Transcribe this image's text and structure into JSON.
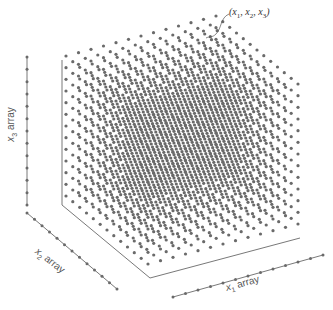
{
  "figure": {
    "type": "3d-meshgrid-diagram",
    "callout_label": "(x1, x2, x3)",
    "callout_parts": {
      "x1": "x",
      "x1_sub": "1",
      "x2": "x",
      "x2_sub": "2",
      "x3": "x",
      "x3_sub": "3"
    },
    "axes": [
      {
        "name": "x1",
        "label_var": "x",
        "label_sub": "1",
        "label_text": "array",
        "direction": "horizontal-right",
        "points": 13
      },
      {
        "name": "x2",
        "label_var": "x",
        "label_sub": "2",
        "label_text": "array",
        "direction": "diagonal-front",
        "points": 13
      },
      {
        "name": "x3",
        "label_var": "x",
        "label_sub": "3",
        "label_text": "array",
        "direction": "vertical-up",
        "points": 13
      }
    ],
    "grid": {
      "nx": 13,
      "ny": 13,
      "nz": 13
    },
    "colors": {
      "point": "#6a6a6a",
      "line": "#555555",
      "background": "#ffffff"
    }
  }
}
